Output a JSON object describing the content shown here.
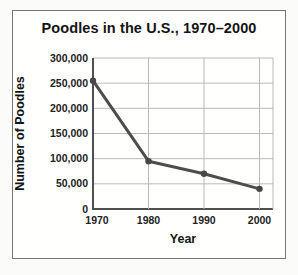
{
  "chart_data": {
    "type": "line",
    "title": "Poodles in the U.S., 1970–2000",
    "xlabel": "Year",
    "ylabel": "Number of Poodles",
    "categories": [
      "1970",
      "1980",
      "1990",
      "2000"
    ],
    "series": [
      {
        "name": "Number of Poodles",
        "values": [
          255000,
          95000,
          70000,
          40000
        ]
      }
    ],
    "ylim": [
      0,
      300000
    ],
    "ytick_step": 50000,
    "grid": true,
    "legend": "none",
    "colors": {
      "line": "#4d4d4d",
      "marker": "#474747",
      "grid": "#b9b9b9",
      "axis": "#4f4f4f",
      "border": "#757575",
      "text": "#141414"
    }
  }
}
